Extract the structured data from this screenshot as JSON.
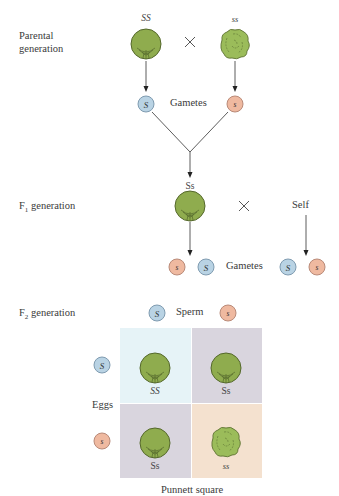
{
  "colors": {
    "smooth_pea": "#8fac4e",
    "smooth_pea_outline": "#5b7030",
    "wrinkled_pea": "#9bbc5a",
    "allele_S": "#b9d3e4",
    "allele_s": "#efb9a0",
    "cell_SS": "#e6f3f7",
    "cell_Ss": "#d9d5de",
    "cell_ss": "#f4e1cf"
  },
  "parental": {
    "label_line1": "Parental",
    "label_line2": "generation",
    "left_genotype": "SS",
    "right_genotype": "ss",
    "cross_symbol": "×",
    "gametes_label": "Gametes",
    "left_gamete": "S",
    "right_gamete": "s"
  },
  "f1": {
    "label_prefix": "F",
    "label_sub": "1",
    "label_suffix": " generation",
    "genotype": "Ss",
    "cross_symbol": "×",
    "self_label": "Self",
    "gametes_label": "Gametes",
    "left_gametes": [
      "s",
      "S"
    ],
    "right_gametes": [
      "S",
      "s"
    ]
  },
  "f2": {
    "label_prefix": "F",
    "label_sub": "2",
    "label_suffix": " generation",
    "sperm_label": "Sperm",
    "sperm": [
      "S",
      "s"
    ],
    "eggs_label": "Eggs",
    "eggs": [
      "S",
      "s"
    ],
    "punnett": {
      "cells": [
        {
          "genotype": "SS",
          "phenotype": "smooth"
        },
        {
          "genotype": "Ss",
          "phenotype": "smooth"
        },
        {
          "genotype": "Ss",
          "phenotype": "smooth"
        },
        {
          "genotype": "ss",
          "phenotype": "wrinkled"
        }
      ],
      "caption": "Punnett square"
    }
  }
}
